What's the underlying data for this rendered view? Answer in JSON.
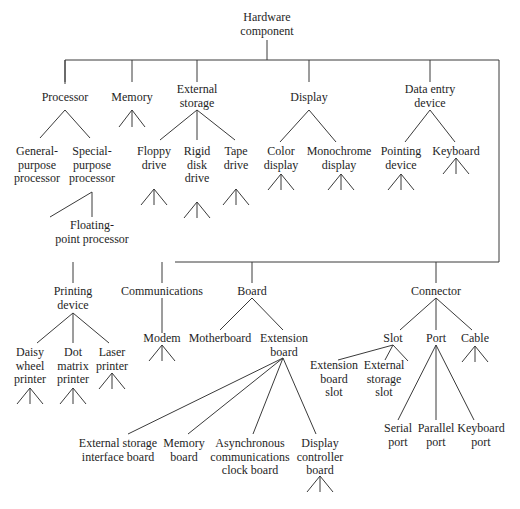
{
  "diagram": {
    "type": "hierarchy-tree",
    "root": "Hardware\ncomponent",
    "nodes": {
      "root": "Hardware\ncomponent",
      "processor": "Processor",
      "memory": "Memory",
      "external_storage": "External\nstorage",
      "display": "Display",
      "data_entry": "Data entry\ndevice",
      "general_purpose": "General-\npurpose\nprocessor",
      "special_purpose": "Special-\npurpose\nprocessor",
      "floating_point": "Floating-\npoint processor",
      "floppy": "Floppy\ndrive",
      "rigid_disk": "Rigid\ndisk\ndrive",
      "tape": "Tape\ndrive",
      "color_display": "Color\ndisplay",
      "mono_display": "Monochrome\ndisplay",
      "pointing": "Pointing\ndevice",
      "keyboard": "Keyboard",
      "printing": "Printing\ndevice",
      "communications": "Communications",
      "board": "Board",
      "connector": "Connector",
      "daisy": "Daisy\nwheel\nprinter",
      "dot_matrix": "Dot\nmatrix\nprinter",
      "laser": "Laser\nprinter",
      "modem": "Modem",
      "motherboard": "Motherboard",
      "extension_board": "Extension\nboard",
      "ext_storage_iface": "External storage\ninterface board",
      "memory_board": "Memory\nboard",
      "async_comm": "Asynchronous\ncommunications\nclock board",
      "display_ctrl": "Display\ncontroller\nboard",
      "slot": "Slot",
      "port": "Port",
      "cable": "Cable",
      "ext_board_slot": "Extension\nboard\nslot",
      "ext_storage_slot": "External\nstorage\nslot",
      "serial_port": "Serial\nport",
      "parallel_port": "Parallel\nport",
      "keyboard_port": "Keyboard\nport"
    },
    "edges": [
      [
        "root",
        "processor"
      ],
      [
        "root",
        "memory"
      ],
      [
        "root",
        "external_storage"
      ],
      [
        "root",
        "display"
      ],
      [
        "root",
        "data_entry"
      ],
      [
        "root",
        "printing"
      ],
      [
        "root",
        "communications"
      ],
      [
        "root",
        "board"
      ],
      [
        "root",
        "connector"
      ],
      [
        "processor",
        "general_purpose"
      ],
      [
        "processor",
        "special_purpose"
      ],
      [
        "special_purpose",
        "floating_point"
      ],
      [
        "external_storage",
        "floppy"
      ],
      [
        "external_storage",
        "rigid_disk"
      ],
      [
        "external_storage",
        "tape"
      ],
      [
        "display",
        "color_display"
      ],
      [
        "display",
        "mono_display"
      ],
      [
        "data_entry",
        "pointing"
      ],
      [
        "data_entry",
        "keyboard"
      ],
      [
        "printing",
        "daisy"
      ],
      [
        "printing",
        "dot_matrix"
      ],
      [
        "printing",
        "laser"
      ],
      [
        "communications",
        "modem"
      ],
      [
        "board",
        "motherboard"
      ],
      [
        "board",
        "extension_board"
      ],
      [
        "extension_board",
        "ext_storage_iface"
      ],
      [
        "extension_board",
        "memory_board"
      ],
      [
        "extension_board",
        "async_comm"
      ],
      [
        "extension_board",
        "display_ctrl"
      ],
      [
        "connector",
        "slot"
      ],
      [
        "connector",
        "port"
      ],
      [
        "connector",
        "cable"
      ],
      [
        "slot",
        "ext_board_slot"
      ],
      [
        "slot",
        "ext_storage_slot"
      ],
      [
        "port",
        "serial_port"
      ],
      [
        "port",
        "parallel_port"
      ],
      [
        "port",
        "keyboard_port"
      ]
    ],
    "line_color": "#3a3a3a",
    "text_color": "#1e1e1e",
    "background": "#ffffff"
  }
}
